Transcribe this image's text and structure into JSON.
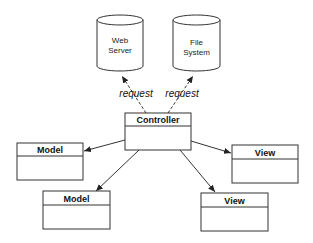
{
  "diagram": {
    "stroke_color": "#333333",
    "background": "#ffffff",
    "datastores": [
      {
        "id": "web-server",
        "line1": "Web",
        "line2": "Server"
      },
      {
        "id": "file-system",
        "line1": "File",
        "line2": "System"
      }
    ],
    "request_labels": [
      "request",
      "request"
    ],
    "controller": {
      "title": "Controller"
    },
    "models": [
      {
        "title": "Model"
      },
      {
        "title": "Model"
      }
    ],
    "views": [
      {
        "title": "View"
      },
      {
        "title": "View"
      }
    ]
  }
}
